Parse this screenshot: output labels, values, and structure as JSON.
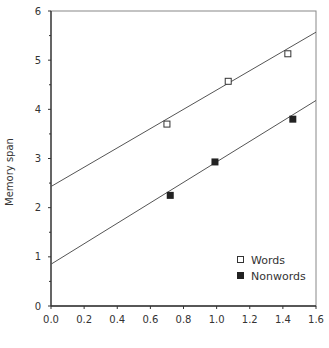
{
  "chart_data": {
    "type": "scatter",
    "title": "",
    "xlabel": "",
    "ylabel": "Memory span",
    "xlim": [
      0.0,
      1.6
    ],
    "ylim": [
      0,
      6
    ],
    "x_ticks": [
      "0.0",
      "0.2",
      "0.4",
      "0.6",
      "0.8",
      "1.0",
      "1.2",
      "1.4",
      "1.6"
    ],
    "y_ticks": [
      "0",
      "1",
      "2",
      "3",
      "4",
      "5",
      "6"
    ],
    "grid": false,
    "legend_position": "lower right",
    "series": [
      {
        "name": "Words",
        "marker": "open-square",
        "points": [
          [
            0.7,
            3.7
          ],
          [
            1.07,
            4.57
          ],
          [
            1.43,
            5.13
          ]
        ],
        "fit_line": {
          "x0": 0.0,
          "y0": 2.43,
          "x1": 1.6,
          "y1": 5.57
        }
      },
      {
        "name": "Nonwords",
        "marker": "filled-square",
        "points": [
          [
            0.72,
            2.25
          ],
          [
            0.99,
            2.93
          ],
          [
            1.46,
            3.8
          ]
        ],
        "fit_line": {
          "x0": 0.0,
          "y0": 0.85,
          "x1": 1.6,
          "y1": 4.18
        }
      }
    ]
  },
  "colors": {
    "axis": "#333333",
    "line": "#555555",
    "marker": "#222222",
    "background": "#ffffff"
  }
}
